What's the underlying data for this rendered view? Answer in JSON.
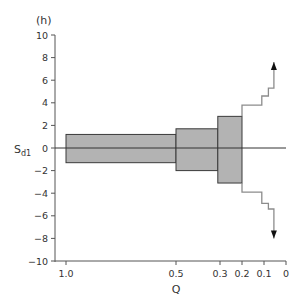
{
  "chart_data": {
    "type": "bar",
    "subtype": "variable-width step chart (symmetric about zero)",
    "panel_label": "(h)",
    "xlabel": "Q",
    "ylabel": "S_d1",
    "ylabel_main": "S",
    "ylabel_sub": "d1",
    "xlim": [
      1.0,
      0
    ],
    "x_reversed": true,
    "ylim": [
      -10,
      10
    ],
    "x_ticks": [
      1.0,
      0.5,
      0.3,
      0.2,
      0.1,
      0
    ],
    "x_tick_labels": [
      "1.0",
      "0.5",
      "0.3",
      "0.2",
      "0.1",
      "0"
    ],
    "y_ticks": [
      10,
      8,
      6,
      4,
      2,
      0,
      -2,
      -4,
      -6,
      -8,
      -10
    ],
    "y_tick_labels": [
      "10",
      "8",
      "6",
      "4",
      "2",
      "0",
      "−2",
      "−4",
      "−6",
      "−8",
      "−10"
    ],
    "grid": false,
    "legend": null,
    "zero_line": true,
    "bars": [
      {
        "q_from": 1.0,
        "q_to": 0.5,
        "upper": 1.2,
        "lower": -1.3
      },
      {
        "q_from": 0.5,
        "q_to": 0.31,
        "upper": 1.7,
        "lower": -2.0
      },
      {
        "q_from": 0.31,
        "q_to": 0.2,
        "upper": 2.8,
        "lower": -3.1
      }
    ],
    "upper_step_line": {
      "points": [
        [
          0.2,
          2.8
        ],
        [
          0.2,
          3.8
        ],
        [
          0.11,
          3.8
        ],
        [
          0.11,
          4.6
        ],
        [
          0.08,
          4.6
        ],
        [
          0.08,
          5.3
        ],
        [
          0.055,
          5.3
        ],
        [
          0.055,
          7.6
        ]
      ],
      "ends_with_arrow": true,
      "direction": "up"
    },
    "lower_step_line": {
      "points": [
        [
          0.2,
          -3.1
        ],
        [
          0.2,
          -3.9
        ],
        [
          0.11,
          -3.9
        ],
        [
          0.11,
          -4.9
        ],
        [
          0.08,
          -4.9
        ],
        [
          0.08,
          -5.4
        ],
        [
          0.055,
          -5.4
        ],
        [
          0.055,
          -8.0
        ]
      ],
      "ends_with_arrow": true,
      "direction": "down"
    },
    "colors": {
      "bar_fill": "#b3b3b3",
      "bar_stroke": "#3a3a3a",
      "step_line": "#8c8c8c",
      "axis": "#555555",
      "zero_line": "#333333"
    }
  }
}
